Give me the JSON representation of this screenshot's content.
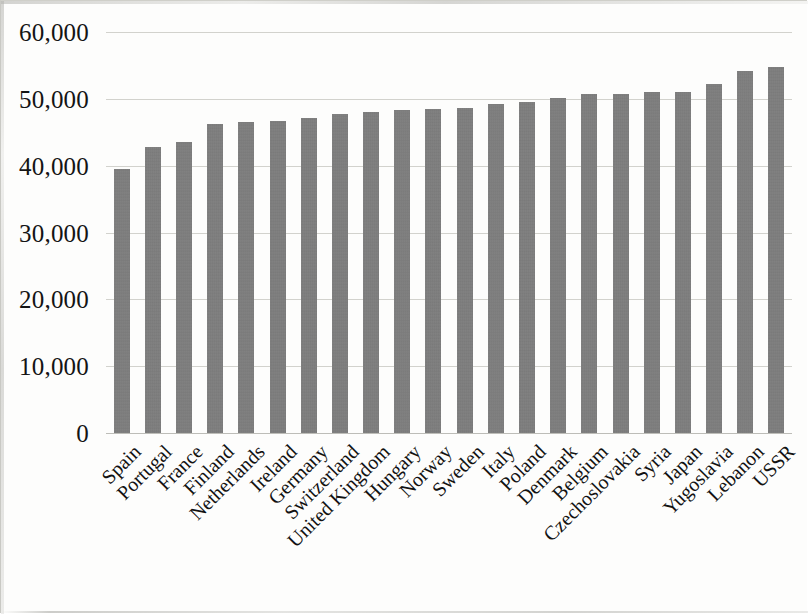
{
  "chart_data": {
    "type": "bar",
    "title": "",
    "subtitle": "",
    "xlabel": "",
    "ylabel": "",
    "ylim": [
      0,
      60000
    ],
    "y_ticks": [
      "0",
      "10,000",
      "20,000",
      "30,000",
      "40,000",
      "50,000",
      "60,000"
    ],
    "y_tick_values": [
      0,
      10000,
      20000,
      30000,
      40000,
      50000,
      60000
    ],
    "grid": true,
    "legend": false,
    "bar_color": "#7d7d7d",
    "gridline_color": "#d2d2cd",
    "categories": [
      "Spain",
      "Portugal",
      "France",
      "Finland",
      "Netherlands",
      "Ireland",
      "Germany",
      "Switzerland",
      "United Kingdom",
      "Hungary",
      "Norway",
      "Sweden",
      "Italy",
      "Poland",
      "Denmark",
      "Belgium",
      "Czechoslovakia",
      "Syria",
      "Japan",
      "Yugoslavia",
      "Lebanon",
      "USSR"
    ],
    "values": [
      39500,
      42800,
      43500,
      46200,
      46500,
      46700,
      47200,
      47700,
      48000,
      48400,
      48500,
      48700,
      49300,
      49600,
      50100,
      50700,
      50800,
      51000,
      51000,
      52200,
      54200,
      54800
    ]
  }
}
